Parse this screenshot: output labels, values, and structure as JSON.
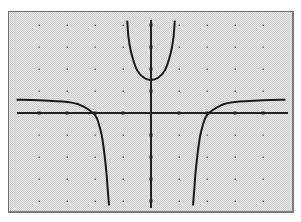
{
  "chart_data": {
    "type": "line",
    "title": "",
    "xlabel": "",
    "ylabel": "",
    "xlim": [
      -5,
      5
    ],
    "ylim": [
      -4,
      4.3
    ],
    "grid": "dots",
    "axes": {
      "x_ticks": [
        -4,
        -3,
        -2,
        -1,
        1,
        2,
        3,
        4
      ],
      "y_ticks": [
        -4,
        -3,
        -2,
        -1,
        1,
        2,
        3,
        4
      ]
    },
    "asymptotes": {
      "vertical": [
        -1.45,
        1.45
      ],
      "horizontal": 0.6
    },
    "series": [
      {
        "name": "left-branch",
        "x": [
          -4.8,
          -4.0,
          -3.0,
          -2.5,
          -2.0,
          -1.8,
          -1.7,
          -1.6,
          -1.55,
          -1.5
        ],
        "y": [
          0.6,
          0.58,
          0.5,
          0.35,
          -0.1,
          -0.8,
          -1.5,
          -2.6,
          -3.4,
          -4.2
        ]
      },
      {
        "name": "middle-branch",
        "x": [
          -0.85,
          -0.8,
          -0.7,
          -0.5,
          -0.25,
          0,
          0.25,
          0.5,
          0.7,
          0.8,
          0.85
        ],
        "y": [
          4.2,
          3.4,
          2.7,
          1.95,
          1.6,
          1.5,
          1.6,
          1.95,
          2.7,
          3.4,
          4.2
        ]
      },
      {
        "name": "right-branch",
        "x": [
          1.5,
          1.55,
          1.6,
          1.7,
          1.8,
          2.0,
          2.5,
          3.0,
          4.0,
          4.8
        ],
        "y": [
          -4.2,
          -3.4,
          -2.6,
          -1.5,
          -0.8,
          -0.1,
          0.35,
          0.5,
          0.58,
          0.6
        ]
      }
    ]
  },
  "colors": {
    "curve": "#1a1a1a",
    "axes": "#222222",
    "grid_dot": "#6a6a6a",
    "frame": "#7a7a7a"
  }
}
